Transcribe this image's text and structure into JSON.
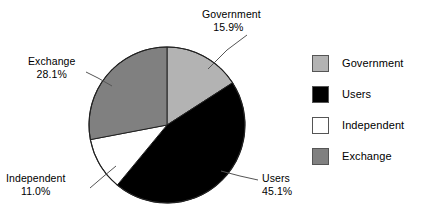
{
  "chart_data": {
    "type": "pie",
    "title": "",
    "subtitle": "",
    "xlabel": "",
    "ylabel": "",
    "grid": false,
    "legend_position": "right",
    "start_angle_deg": 0,
    "direction": "clockwise",
    "categories": [
      "Government",
      "Users",
      "Independent",
      "Exchange"
    ],
    "values": [
      15.9,
      45.1,
      11.0,
      28.1
    ],
    "value_unit": "%",
    "colors": [
      "#b3b3b3",
      "#000000",
      "#ffffff",
      "#808080"
    ],
    "slices": [
      {
        "label": "Government",
        "percent_text": "15.9%",
        "value": 15.9,
        "color": "#b3b3b3",
        "start_deg": 0.0,
        "end_deg": 57.24
      },
      {
        "label": "Users",
        "percent_text": "45.1%",
        "value": 45.1,
        "color": "#000000",
        "start_deg": 57.24,
        "end_deg": 219.6
      },
      {
        "label": "Independent",
        "percent_text": "11.0%",
        "value": 11.0,
        "color": "#ffffff",
        "start_deg": 219.6,
        "end_deg": 259.2
      },
      {
        "label": "Exchange",
        "percent_text": "28.1%",
        "value": 28.1,
        "color": "#808080",
        "start_deg": 259.2,
        "end_deg": 360.0
      }
    ]
  },
  "labels": {
    "government": {
      "name": "Government",
      "percent": "15.9%"
    },
    "users": {
      "name": "Users",
      "percent": "45.1%"
    },
    "independent": {
      "name": "Independent",
      "percent": "11.0%"
    },
    "exchange": {
      "name": "Exchange",
      "percent": "28.1%"
    }
  },
  "legend": {
    "items": [
      {
        "label": "Government",
        "color": "#b3b3b3"
      },
      {
        "label": "Users",
        "color": "#000000"
      },
      {
        "label": "Independent",
        "color": "#ffffff"
      },
      {
        "label": "Exchange",
        "color": "#808080"
      }
    ]
  },
  "style": {
    "background": "#ffffff",
    "outline": "#222222",
    "leader_line": "#555555"
  }
}
